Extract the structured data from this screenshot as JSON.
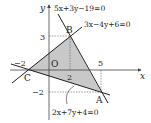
{
  "figure": {
    "axes": {
      "x_label": "x",
      "y_label": "y",
      "origin_label": "O",
      "ticks": {
        "x_neg2": "−2",
        "x_2": "2",
        "x_5": "5",
        "y_3": "3",
        "y_neg2": "−2"
      }
    },
    "points": [
      {
        "label": "A",
        "x": 5,
        "y": -2
      },
      {
        "label": "B",
        "x": 2,
        "y": 3
      },
      {
        "label": "C",
        "x": -2,
        "y": 0
      }
    ],
    "lines": [
      {
        "id": "AB",
        "equation": "5x+3y−19=0"
      },
      {
        "id": "BC",
        "equation": "3x−4y+6=0"
      },
      {
        "id": "CA",
        "equation": "2x+7y+4=0"
      }
    ],
    "region": {
      "fill": "#c8c8c8",
      "description": "shaded triangle ABC"
    }
  }
}
